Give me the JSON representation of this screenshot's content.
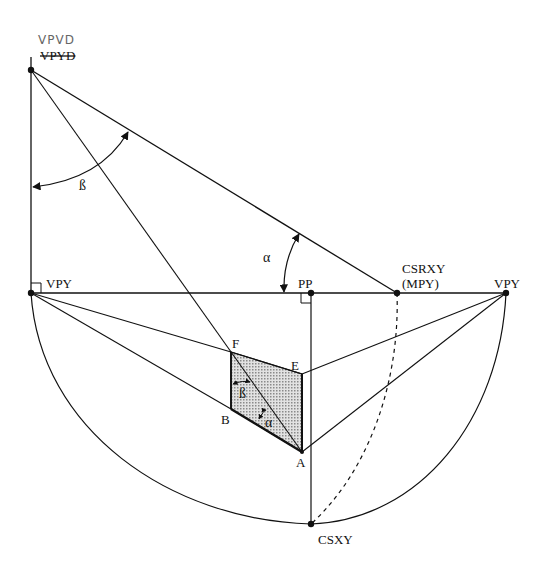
{
  "diagram": {
    "title": "",
    "colors": {
      "ink": "#111111",
      "shade": "#bdbdbd",
      "handwriting": "#666666",
      "background": "#ffffff"
    },
    "labels": {
      "vpyd_handwritten": "VPVD",
      "vpyd": "VPYD",
      "vpy_left": "VPY",
      "vpy_right": "VPY",
      "pp": "PP",
      "csrxy": "CSRXY",
      "mpy": "(MPY)",
      "csxy": "CSXY",
      "f": "F",
      "e": "E",
      "b": "B",
      "a": "A",
      "alpha_top": "α",
      "beta_top": "ß",
      "alpha_inner": "α",
      "beta_inner": "ß"
    },
    "points": {
      "VPYD": [
        31,
        70
      ],
      "VPY_left": [
        31,
        293
      ],
      "PP": [
        311,
        293
      ],
      "CSRXY": [
        397,
        293
      ],
      "VPY_right": [
        506,
        293
      ],
      "CSXY": [
        311,
        524
      ],
      "F": [
        231,
        352
      ],
      "E": [
        302,
        374
      ],
      "B": [
        231,
        409
      ],
      "A": [
        302,
        452
      ]
    }
  }
}
